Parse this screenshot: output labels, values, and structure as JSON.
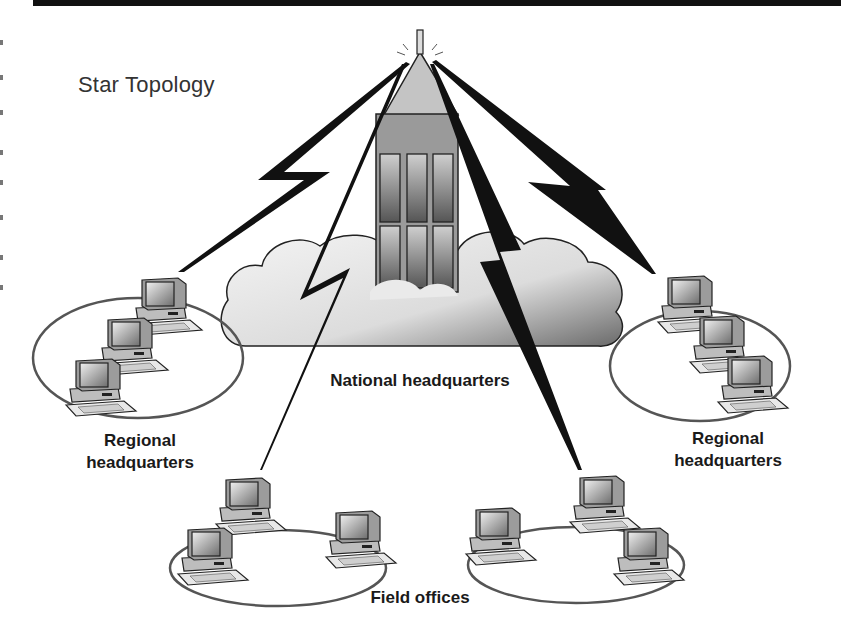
{
  "diagram": {
    "title": "Star Topology",
    "hub": {
      "label": "National headquarters",
      "icon": "building-in-cloud-icon"
    },
    "nodes": [
      {
        "id": "regional-left",
        "label_line1": "Regional",
        "label_line2": "headquarters",
        "computers": 3,
        "icon": "computer-ring-icon"
      },
      {
        "id": "regional-right",
        "label_line1": "Regional",
        "label_line2": "headquarters",
        "computers": 3,
        "icon": "computer-ring-icon"
      },
      {
        "id": "field-left",
        "computers": 3,
        "icon": "computer-ring-icon"
      },
      {
        "id": "field-right",
        "computers": 3,
        "icon": "computer-ring-icon"
      }
    ],
    "field_label": "Field offices",
    "links": [
      {
        "from": "hub",
        "to": "regional-left",
        "type": "lightning-bolt"
      },
      {
        "from": "hub",
        "to": "regional-right",
        "type": "lightning-bolt"
      },
      {
        "from": "hub",
        "to": "field-left",
        "type": "lightning-bolt"
      },
      {
        "from": "hub",
        "to": "field-right",
        "type": "lightning-bolt"
      }
    ],
    "colors": {
      "background": "#ffffff",
      "ink": "#111111",
      "building_fill": "#9a9a9a",
      "cloud_fill": "#e6e6e6"
    }
  }
}
